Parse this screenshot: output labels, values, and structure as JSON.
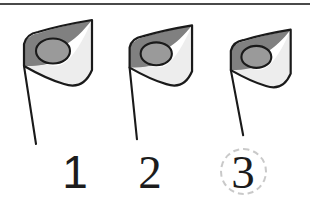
{
  "page": {
    "background_color": "#ffffff",
    "divider_color": "#4a4a4a"
  },
  "colors": {
    "flag_dark": "#808080",
    "flag_light": "#ededed",
    "flag_oval": "#9a9a9a",
    "outline": "#1a1a1a",
    "pole": "#1a1a1a",
    "numeral": "#1c1c1c",
    "selection_ring": "#c9c9c9"
  },
  "flags": [
    {
      "id": "flag-1",
      "label": "flag-large",
      "size": "large",
      "scale": 1.0
    },
    {
      "id": "flag-2",
      "label": "flag-medium",
      "size": "medium",
      "scale": 0.86
    },
    {
      "id": "flag-3",
      "label": "flag-small",
      "size": "small",
      "scale": 0.78
    }
  ],
  "numbers": [
    {
      "id": "number-1",
      "value": "1",
      "selected": false
    },
    {
      "id": "number-2",
      "value": "2",
      "selected": false
    },
    {
      "id": "number-3",
      "value": "3",
      "selected": true
    }
  ],
  "selection": {
    "selected_value": "3",
    "ring_style": "dashed-circle"
  }
}
